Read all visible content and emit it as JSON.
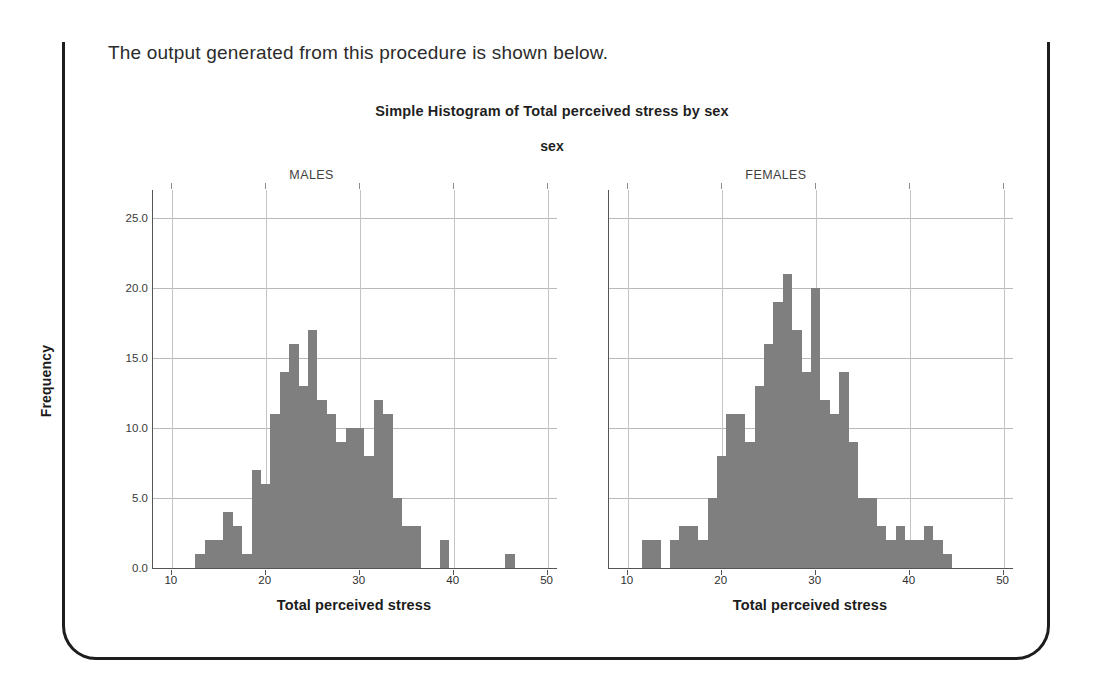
{
  "document": {
    "intro_text": "The output generated from this procedure is shown below."
  },
  "chart": {
    "title": "Simple Histogram of Total perceived stress by sex",
    "panel_variable_title": "sex",
    "y_axis_title": "Frequency",
    "x_axis_title": "Total perceived stress",
    "bar_color": "#7f7f7f",
    "grid_color": "#b9b9b9",
    "axis_color": "#555555",
    "panels": [
      {
        "label": "MALES"
      },
      {
        "label": "FEMALES"
      }
    ]
  },
  "chart_data": {
    "type": "bar",
    "chart_style": "histogram",
    "title": "Simple Histogram of Total perceived stress by sex",
    "subtitle": "sex",
    "panel_variable": "sex",
    "xlabel": "Total perceived stress",
    "ylabel": "Frequency",
    "xlim": [
      8,
      51
    ],
    "ylim": [
      0,
      27
    ],
    "y_ticks": [
      "0.0",
      "5.0",
      "10.0",
      "15.0",
      "20.0",
      "25.0"
    ],
    "y_tick_values": [
      0,
      5,
      10,
      15,
      20,
      25
    ],
    "x_ticks": [
      "10",
      "20",
      "30",
      "40",
      "50"
    ],
    "x_tick_values": [
      10,
      20,
      30,
      40,
      50
    ],
    "grid": "horizontal-and-vertical",
    "legend": "none",
    "bin_width": 1,
    "panels": [
      {
        "name": "MALES",
        "x": [
          13,
          14,
          15,
          16,
          17,
          18,
          19,
          20,
          21,
          22,
          23,
          24,
          25,
          26,
          27,
          28,
          29,
          30,
          31,
          32,
          33,
          34,
          35,
          36,
          39,
          46
        ],
        "values": [
          1,
          2,
          2,
          4,
          3,
          1,
          7,
          6,
          11,
          14,
          16,
          13,
          17,
          12,
          11,
          9,
          10,
          10,
          8,
          12,
          11,
          5,
          3,
          3,
          2,
          1
        ]
      },
      {
        "name": "FEMALES",
        "x": [
          12,
          13,
          15,
          16,
          17,
          18,
          19,
          20,
          21,
          22,
          23,
          24,
          25,
          26,
          27,
          28,
          29,
          30,
          31,
          32,
          33,
          34,
          35,
          36,
          37,
          38,
          39,
          40,
          41,
          42,
          43,
          44
        ],
        "values": [
          2,
          2,
          2,
          3,
          3,
          2,
          5,
          8,
          11,
          11,
          9,
          13,
          16,
          19,
          21,
          17,
          14,
          20,
          12,
          11,
          14,
          9,
          5,
          5,
          3,
          2,
          3,
          2,
          2,
          3,
          2,
          1
        ]
      }
    ]
  }
}
